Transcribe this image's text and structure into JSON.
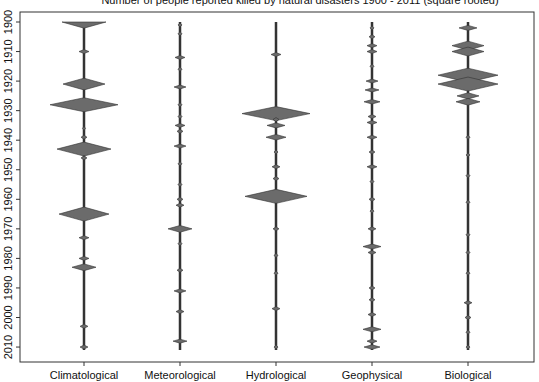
{
  "chart_data": {
    "type": "violin",
    "title": "Number of people reported killed by natural disasters 1900 - 2011 (square rooted)",
    "xlabel": "",
    "ylabel": "",
    "categories": [
      "Climatological",
      "Meteorological",
      "Hydrological",
      "Geophysical",
      "Biological"
    ],
    "yaxis": {
      "ticks": [
        1900,
        1910,
        1920,
        1930,
        1940,
        1950,
        1960,
        1970,
        1980,
        1990,
        2000,
        2010
      ],
      "orientation": "reversed",
      "range": [
        1897,
        2014
      ]
    },
    "grid": false,
    "legend": "none",
    "fill_color": "#6b6b6b",
    "stroke_color": "#333333",
    "series": [
      {
        "name": "Climatological",
        "x_px": 84,
        "diamonds": [
          {
            "year": 1900,
            "half_width": 22,
            "shape": "top"
          },
          {
            "year": 1910,
            "half_width": 5
          },
          {
            "year": 1921,
            "half_width": 21
          },
          {
            "year": 1928,
            "half_width": 34
          },
          {
            "year": 1936,
            "half_width": 1.5
          },
          {
            "year": 1939,
            "half_width": 3
          },
          {
            "year": 1943,
            "half_width": 27
          },
          {
            "year": 1946,
            "half_width": 3
          },
          {
            "year": 1965,
            "half_width": 25
          },
          {
            "year": 1973,
            "half_width": 5
          },
          {
            "year": 1980,
            "half_width": 5
          },
          {
            "year": 1983,
            "half_width": 12
          },
          {
            "year": 2003,
            "half_width": 4
          },
          {
            "year": 2010,
            "half_width": 4
          }
        ]
      },
      {
        "name": "Meteorological",
        "x_px": 180,
        "diamonds": [
          {
            "year": 1901,
            "half_width": 2
          },
          {
            "year": 1904,
            "half_width": 2
          },
          {
            "year": 1912,
            "half_width": 5
          },
          {
            "year": 1916,
            "half_width": 2
          },
          {
            "year": 1922,
            "half_width": 6
          },
          {
            "year": 1928,
            "half_width": 2
          },
          {
            "year": 1932,
            "half_width": 2
          },
          {
            "year": 1935,
            "half_width": 5
          },
          {
            "year": 1937,
            "half_width": 3
          },
          {
            "year": 1942,
            "half_width": 6
          },
          {
            "year": 1948,
            "half_width": 2
          },
          {
            "year": 1955,
            "half_width": 2
          },
          {
            "year": 1960,
            "half_width": 3
          },
          {
            "year": 1962,
            "half_width": 4
          },
          {
            "year": 1970,
            "half_width": 12
          },
          {
            "year": 1975,
            "half_width": 2
          },
          {
            "year": 1984,
            "half_width": 3
          },
          {
            "year": 1991,
            "half_width": 6
          },
          {
            "year": 1998,
            "half_width": 4
          },
          {
            "year": 2008,
            "half_width": 7
          }
        ]
      },
      {
        "name": "Hydrological",
        "x_px": 276,
        "diamonds": [
          {
            "year": 1911,
            "half_width": 5
          },
          {
            "year": 1931,
            "half_width": 34
          },
          {
            "year": 1933,
            "half_width": 3
          },
          {
            "year": 1935,
            "half_width": 9
          },
          {
            "year": 1939,
            "half_width": 10
          },
          {
            "year": 1944,
            "half_width": 2
          },
          {
            "year": 1949,
            "half_width": 4
          },
          {
            "year": 1953,
            "half_width": 3
          },
          {
            "year": 1959,
            "half_width": 31
          },
          {
            "year": 1970,
            "half_width": 3
          },
          {
            "year": 1979,
            "half_width": 2
          },
          {
            "year": 1985,
            "half_width": 2
          },
          {
            "year": 1997,
            "half_width": 4
          },
          {
            "year": 2010,
            "half_width": 2
          }
        ]
      },
      {
        "name": "Geophysical",
        "x_px": 372,
        "diamonds": [
          {
            "year": 1902,
            "half_width": 2
          },
          {
            "year": 1905,
            "half_width": 3
          },
          {
            "year": 1908,
            "half_width": 5
          },
          {
            "year": 1910,
            "half_width": 5
          },
          {
            "year": 1915,
            "half_width": 2
          },
          {
            "year": 1920,
            "half_width": 6
          },
          {
            "year": 1923,
            "half_width": 7
          },
          {
            "year": 1927,
            "half_width": 8
          },
          {
            "year": 1932,
            "half_width": 4
          },
          {
            "year": 1934,
            "half_width": 5
          },
          {
            "year": 1939,
            "half_width": 5
          },
          {
            "year": 1944,
            "half_width": 3
          },
          {
            "year": 1949,
            "half_width": 5
          },
          {
            "year": 1954,
            "half_width": 2
          },
          {
            "year": 1960,
            "half_width": 3
          },
          {
            "year": 1964,
            "half_width": 2
          },
          {
            "year": 1970,
            "half_width": 4
          },
          {
            "year": 1976,
            "half_width": 9
          },
          {
            "year": 1978,
            "half_width": 4
          },
          {
            "year": 1990,
            "half_width": 3
          },
          {
            "year": 1994,
            "half_width": 3
          },
          {
            "year": 1999,
            "half_width": 4
          },
          {
            "year": 2004,
            "half_width": 9
          },
          {
            "year": 2008,
            "half_width": 5
          },
          {
            "year": 2010,
            "half_width": 8
          }
        ]
      },
      {
        "name": "Biological",
        "x_px": 468,
        "diamonds": [
          {
            "year": 1902,
            "half_width": 9
          },
          {
            "year": 1908,
            "half_width": 16
          },
          {
            "year": 1910,
            "half_width": 16
          },
          {
            "year": 1918,
            "half_width": 30
          },
          {
            "year": 1921,
            "half_width": 30
          },
          {
            "year": 1925,
            "half_width": 11
          },
          {
            "year": 1927,
            "half_width": 12
          },
          {
            "year": 1939,
            "half_width": 2
          },
          {
            "year": 1945,
            "half_width": 2
          },
          {
            "year": 1952,
            "half_width": 2
          },
          {
            "year": 1961,
            "half_width": 2
          },
          {
            "year": 1972,
            "half_width": 2
          },
          {
            "year": 1978,
            "half_width": 2
          },
          {
            "year": 1985,
            "half_width": 2
          },
          {
            "year": 1995,
            "half_width": 4
          },
          {
            "year": 2000,
            "half_width": 3
          },
          {
            "year": 2005,
            "half_width": 2
          },
          {
            "year": 2010,
            "half_width": 2
          }
        ]
      }
    ]
  }
}
